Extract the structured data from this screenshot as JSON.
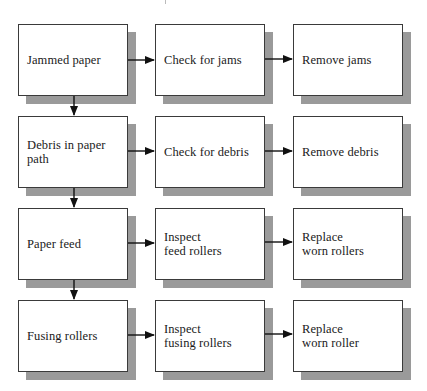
{
  "diagram": {
    "type": "troubleshooting-flowchart",
    "colors": {
      "box_fill": "#ffffff",
      "box_border": "#3a3a3a",
      "shadow": "#9a9a9a",
      "arrow": "#111111",
      "text": "#1a1a1a"
    },
    "rows": [
      {
        "problem": "Jammed paper",
        "check": "Check for jams",
        "action": "Remove jams"
      },
      {
        "problem": "Debris in paper\npath",
        "check": "Check for debris",
        "action": "Remove debris"
      },
      {
        "problem": "Paper feed",
        "check": "Inspect\nfeed rollers",
        "action": "Replace\nworn rollers"
      },
      {
        "problem": "Fusing rollers",
        "check": "Inspect\nfusing rollers",
        "action": "Replace\nworn roller"
      }
    ],
    "edges": [
      {
        "from": "Jammed paper",
        "to": "Check for jams"
      },
      {
        "from": "Check for jams",
        "to": "Remove jams"
      },
      {
        "from": "Jammed paper",
        "to": "Debris in paper path"
      },
      {
        "from": "Debris in paper path",
        "to": "Check for debris"
      },
      {
        "from": "Check for debris",
        "to": "Remove debris"
      },
      {
        "from": "Debris in paper path",
        "to": "Paper feed"
      },
      {
        "from": "Paper feed",
        "to": "Inspect feed rollers"
      },
      {
        "from": "Inspect feed rollers",
        "to": "Replace worn rollers"
      },
      {
        "from": "Paper feed",
        "to": "Fusing rollers"
      },
      {
        "from": "Fusing rollers",
        "to": "Inspect fusing rollers"
      },
      {
        "from": "Inspect fusing rollers",
        "to": "Replace worn roller"
      }
    ]
  }
}
